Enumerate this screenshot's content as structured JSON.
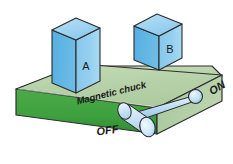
{
  "figure": {
    "kind": "isometric-diagram",
    "background_color": "#ffffff"
  },
  "chuck": {
    "label": "Magnetic chuck",
    "top_color": "#b9d3ac",
    "front_color": "#3ea03e",
    "end_color": "#a9c79c",
    "edge_color": "#2f2f2f"
  },
  "blocks": [
    {
      "id": "A",
      "label": "A",
      "top_color": "#9ed2ef",
      "front_color": "#8fcbee",
      "side_color": "#5fb3e3",
      "edge_color": "#2b2b2b"
    },
    {
      "id": "B",
      "label": "B",
      "top_color": "#9ed2ef",
      "front_color": "#8fcbee",
      "side_color": "#5fb3e3",
      "edge_color": "#2b2b2b"
    }
  ],
  "lever": {
    "off_label": "OFF",
    "on_label": "ON",
    "position": "off",
    "handle_color": "#cfe6f6",
    "shaft_color": "#bcdcf2",
    "knob_color": "#bcdcf2",
    "edge_color": "#2b2b2b"
  }
}
